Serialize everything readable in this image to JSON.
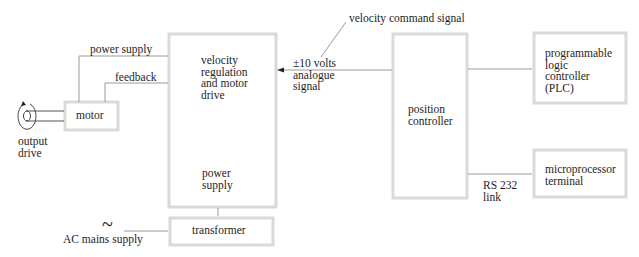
{
  "diagram": {
    "blocks": {
      "velocity_drive": {
        "label": "velocity\nregulation\nand motor\ndrive",
        "sublabel": "power\nsupply"
      },
      "motor": {
        "label": "motor"
      },
      "position_controller": {
        "label": "position\ncontroller"
      },
      "plc": {
        "label": "programmable\nlogic\ncontroller\n(PLC)"
      },
      "microprocessor": {
        "label": "microprocessor\nterminal"
      },
      "transformer": {
        "label": "transformer"
      }
    },
    "connections": {
      "power_supply": "power supply",
      "feedback": "feedback",
      "analogue_signal": "±10 volts\nanalogue\nsignal",
      "velocity_command": "velocity command signal",
      "rs232": "RS 232\nlink",
      "ac_mains": "AC mains supply",
      "ac_symbol": "~",
      "output_drive": "output\ndrive"
    }
  }
}
